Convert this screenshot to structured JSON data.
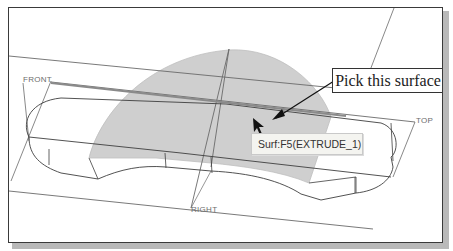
{
  "viewport": {
    "datum_planes": {
      "front": "FRONT",
      "top": "TOP",
      "right": "RIGHT"
    },
    "selected_surface_fill": "#c8c8c8",
    "line_color": "#4a4a4a"
  },
  "annotation": {
    "callout_text": "Pick this surface"
  },
  "tooltip": {
    "text": "Surf:F5(EXTRUDE_1)"
  }
}
